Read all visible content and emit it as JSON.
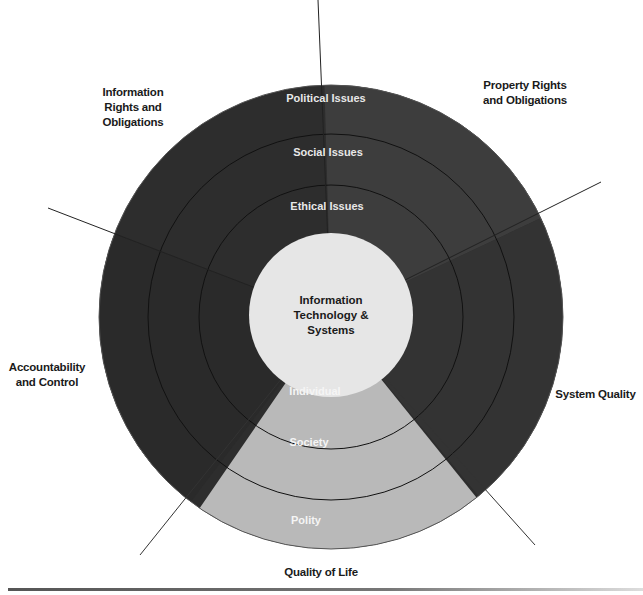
{
  "diagram": {
    "center_label": "Information Technology & Systems",
    "center_lines": [
      "Information",
      "Technology &",
      "Systems"
    ],
    "ring_labels_top": [
      "Political Issues",
      "Social Issues",
      "Ethical Issues"
    ],
    "ring_labels_bottom": [
      "Individual",
      "Society",
      "Polity"
    ],
    "dimensions": [
      {
        "id": "info_rights",
        "lines": [
          "Information",
          "Rights and",
          "Obligations"
        ]
      },
      {
        "id": "property_rights",
        "lines": [
          "Property Rights",
          "and Obligations"
        ]
      },
      {
        "id": "accountability",
        "lines": [
          "Accountability",
          "and Control"
        ]
      },
      {
        "id": "system_quality",
        "lines": [
          "System Quality"
        ]
      },
      {
        "id": "quality_of_life",
        "lines": [
          "Quality of Life"
        ]
      }
    ],
    "colors": {
      "dark_sector": "#2e2e2e",
      "mid_sector": "#3c3c3c",
      "light_sector": "#b9b9b9",
      "center": "#e6e6e6",
      "ring_line": "#111111"
    }
  }
}
